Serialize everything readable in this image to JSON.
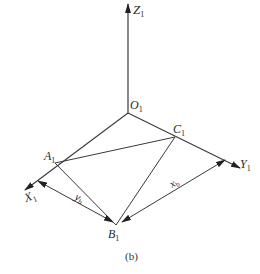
{
  "diagram": {
    "type": "axonometric-coordinate-system",
    "caption": "(b)",
    "colors": {
      "line": "#3a3a3a",
      "text": "#2a2a2a",
      "background": "#ffffff"
    },
    "axes": [
      {
        "id": "Z1",
        "label": "Z",
        "subscript": "1",
        "direction": "up"
      },
      {
        "id": "X1",
        "label": "X",
        "subscript": "1",
        "direction": "down-left"
      },
      {
        "id": "Y1",
        "label": "Y",
        "subscript": "1",
        "direction": "down-right"
      }
    ],
    "points": [
      {
        "id": "O1",
        "label": "O",
        "subscript": "1",
        "role": "origin"
      },
      {
        "id": "A1",
        "label": "A",
        "subscript": "1",
        "on": "X1-axis"
      },
      {
        "id": "C1",
        "label": "C",
        "subscript": "1",
        "on": "Y1-axis"
      },
      {
        "id": "B1",
        "label": "B",
        "subscript": "1",
        "role": "triangle-vertex"
      }
    ],
    "edges": [
      [
        "A1",
        "C1"
      ],
      [
        "A1",
        "B1"
      ],
      [
        "C1",
        "B1"
      ]
    ],
    "dimensions": [
      {
        "id": "yb",
        "label": "y",
        "subscript": "b",
        "between": [
          "X1-axis",
          "B1"
        ]
      },
      {
        "id": "xb",
        "label": "x",
        "subscript": "b",
        "between": [
          "B1",
          "Y1-axis"
        ]
      }
    ]
  }
}
